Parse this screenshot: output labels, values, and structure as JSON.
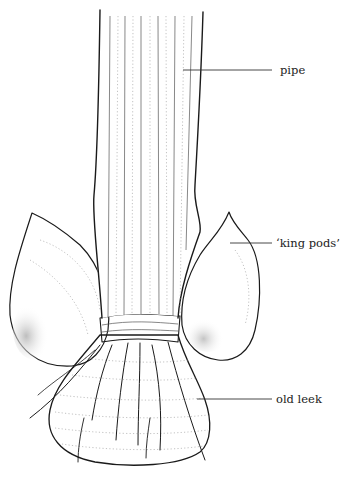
{
  "figure": {
    "labels": [
      {
        "id": "pipe",
        "text": "pipe"
      },
      {
        "id": "king-pods",
        "text": "‘king pods’"
      },
      {
        "id": "old-leek",
        "text": "old leek"
      }
    ]
  }
}
